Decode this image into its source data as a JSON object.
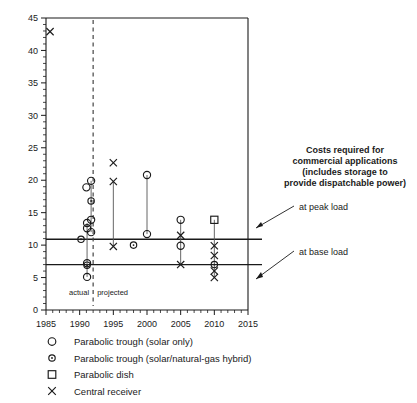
{
  "chart_data": {
    "type": "scatter",
    "title": "",
    "xlabel": "",
    "ylabel": "",
    "xlim": [
      1985,
      2015
    ],
    "ylim": [
      0,
      45
    ],
    "xticks": [
      1985,
      1990,
      1995,
      2000,
      2005,
      2010,
      2015
    ],
    "xtick_labels": [
      "1985",
      "1990",
      "1995",
      "2000",
      "2005",
      "2010",
      "2015"
    ],
    "xtick_minor_step": 1,
    "yticks": [
      0,
      5,
      10,
      15,
      20,
      25,
      30,
      35,
      40,
      45
    ],
    "ytick_labels": [
      "0",
      "5",
      "10",
      "15",
      "20",
      "25",
      "30",
      "35",
      "40",
      "45"
    ],
    "ytick_minor_step": 1,
    "grid": false,
    "legend_position": "below-axes",
    "series": [
      {
        "name": "Parabolic trough (solar only)",
        "marker": "open-circle",
        "points": [
          {
            "x": 1991.0,
            "y": 18.9
          },
          {
            "x": 1991.7,
            "y": 19.9
          },
          {
            "x": 1991.7,
            "y": 13.9
          },
          {
            "x": 1991.1,
            "y": 13.4
          },
          {
            "x": 1991.1,
            "y": 12.6
          },
          {
            "x": 1991.7,
            "y": 12.0
          },
          {
            "x": 1991.1,
            "y": 7.2
          },
          {
            "x": 1991.1,
            "y": 5.1
          },
          {
            "x": 2000.0,
            "y": 20.8
          },
          {
            "x": 2000.0,
            "y": 11.7
          },
          {
            "x": 2005.0,
            "y": 13.9
          },
          {
            "x": 2005.0,
            "y": 9.9
          }
        ]
      },
      {
        "name": "Parabolic trough (solar/natural-gas hybrid)",
        "marker": "dot-circle",
        "points": [
          {
            "x": 1991.7,
            "y": 16.8
          },
          {
            "x": 1990.2,
            "y": 10.9
          },
          {
            "x": 1991.1,
            "y": 6.9
          },
          {
            "x": 1998.0,
            "y": 10.0
          },
          {
            "x": 2010.0,
            "y": 7.0
          }
        ]
      },
      {
        "name": "Parabolic dish",
        "marker": "open-square",
        "points": [
          {
            "x": 2010.0,
            "y": 13.9
          }
        ]
      },
      {
        "name": "Central receiver",
        "marker": "cross",
        "points": [
          {
            "x": 1985.6,
            "y": 42.9
          },
          {
            "x": 1995.0,
            "y": 22.7
          },
          {
            "x": 1995.0,
            "y": 19.8
          },
          {
            "x": 1995.0,
            "y": 9.8
          },
          {
            "x": 2005.0,
            "y": 11.5
          },
          {
            "x": 2005.0,
            "y": 7.0
          },
          {
            "x": 2010.0,
            "y": 9.9
          },
          {
            "x": 2010.0,
            "y": 8.4
          },
          {
            "x": 2010.0,
            "y": 6.0
          },
          {
            "x": 2010.0,
            "y": 5.0
          }
        ]
      }
    ],
    "connectors": [
      {
        "x": 1995.0,
        "y_top": 19.8,
        "y_bottom": 9.8
      },
      {
        "x": 2000.0,
        "y_top": 20.8,
        "y_bottom": 11.7
      },
      {
        "x": 2005.0,
        "y_top": 13.9,
        "y_bottom": 7.0
      },
      {
        "x": 2010.0,
        "y_top": 13.9,
        "y_bottom": 5.0
      },
      {
        "x": 1991.7,
        "y_top": 19.9,
        "y_bottom": 12.0
      },
      {
        "x": 1991.1,
        "y_top": 13.4,
        "y_bottom": 5.1
      }
    ],
    "reference_lines": [
      {
        "label": "at peak load",
        "y": 10.9
      },
      {
        "label": "at base load",
        "y": 7.0
      }
    ],
    "divider": {
      "x": 1992.0,
      "style": "dashed",
      "left_label": "actual",
      "right_label": "projected"
    },
    "annotation": {
      "lines": [
        "Costs required for",
        "commercial applications",
        "(includes storage to",
        "provide dispatchable power)"
      ],
      "callouts": [
        "at peak load",
        "at base load"
      ]
    },
    "legend": [
      {
        "marker": "open-circle",
        "label": "Parabolic trough (solar only)"
      },
      {
        "marker": "dot-circle",
        "label": "Parabolic trough (solar/natural-gas hybrid)"
      },
      {
        "marker": "open-square",
        "label": "Parabolic dish"
      },
      {
        "marker": "cross",
        "label": "Central receiver"
      }
    ],
    "colors": {
      "ink": "#1a1a1a",
      "background": "#ffffff",
      "connector": "#555555",
      "divider": "#444444"
    }
  }
}
